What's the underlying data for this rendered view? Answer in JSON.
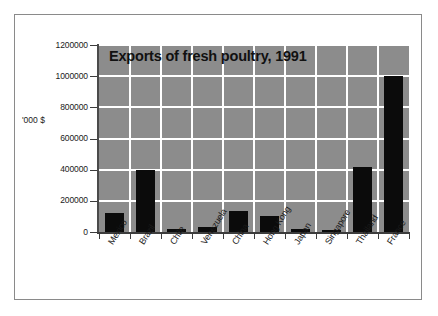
{
  "chart_data": {
    "type": "bar",
    "title": "Exports of fresh poultry, 1991",
    "xlabel": "",
    "ylabel": "'000 $",
    "categories": [
      "Mexico",
      "Brazil",
      "Chile",
      "Venezuela",
      "China",
      "Hong Kong",
      "Japan",
      "Singapore",
      "Thailand",
      "France"
    ],
    "values": [
      120000,
      400000,
      20000,
      35000,
      135000,
      100000,
      18000,
      15000,
      415000,
      1000000
    ],
    "series": [
      {
        "name": "Exports",
        "values": [
          120000,
          400000,
          20000,
          35000,
          135000,
          100000,
          18000,
          15000,
          415000,
          1000000
        ]
      }
    ],
    "ylim": [
      0,
      1200000
    ],
    "ytick_values": [
      0,
      200000,
      400000,
      600000,
      800000,
      1000000,
      1200000
    ],
    "ytick_labels": [
      "0",
      "200000",
      "400000",
      "600000",
      "800000",
      "1000000",
      "1200000"
    ],
    "grid": "horizontal-and-vertical",
    "legend": "none",
    "colors": {
      "bar": "#0b0b0b",
      "plot_background": "#8c8c8c",
      "gridline": "#ffffff",
      "axis": "#3c3c3c",
      "page_background": "#ffffff",
      "frame_border": "#8a8a8a",
      "text": "#1a1a1a"
    }
  }
}
